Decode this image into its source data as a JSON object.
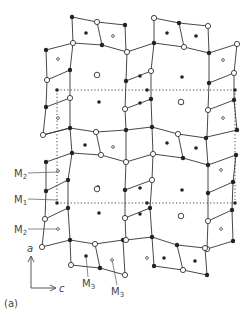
{
  "figure": {
    "panel_label": "(a)",
    "axes": {
      "vertical": "a",
      "horizontal": "c"
    },
    "site_labels": [
      {
        "text": "M",
        "sub": "2",
        "x": 14,
        "y": 177,
        "tx": 58,
        "ty": 172
      },
      {
        "text": "M",
        "sub": "1",
        "x": 14,
        "y": 203,
        "tx": 58,
        "ty": 200
      },
      {
        "text": "M",
        "sub": "2",
        "x": 14,
        "y": 233,
        "tx": 58,
        "ty": 229
      },
      {
        "text": "M",
        "sub": "3",
        "x": 82,
        "y": 287,
        "tx": 86,
        "ty": 256
      },
      {
        "text": "M",
        "sub": "3",
        "x": 111,
        "y": 295,
        "tx": 112,
        "ty": 260
      }
    ],
    "legend": {
      "filled": "filled circle",
      "open": "open circle",
      "dot": "small dot"
    },
    "colors": {
      "line": "#333333",
      "dotted": "#444444",
      "text": "#444444"
    }
  },
  "lattice": {
    "edges": [
      [
        [
          72,
          17
        ],
        [
          97,
          22
        ]
      ],
      [
        [
          97,
          22
        ],
        [
          125,
          25
        ]
      ],
      [
        [
          72,
          17
        ],
        [
          73,
          43
        ]
      ],
      [
        [
          97,
          22
        ],
        [
          102,
          45
        ]
      ],
      [
        [
          125,
          25
        ],
        [
          126,
          52
        ]
      ],
      [
        [
          73,
          43
        ],
        [
          102,
          45
        ]
      ],
      [
        [
          102,
          45
        ],
        [
          127,
          52
        ]
      ],
      [
        [
          154,
          18
        ],
        [
          179,
          23
        ]
      ],
      [
        [
          179,
          23
        ],
        [
          208,
          26
        ]
      ],
      [
        [
          154,
          18
        ],
        [
          154,
          43
        ]
      ],
      [
        [
          179,
          23
        ],
        [
          184,
          47
        ]
      ],
      [
        [
          208,
          26
        ],
        [
          209,
          53
        ]
      ],
      [
        [
          154,
          43
        ],
        [
          184,
          47
        ]
      ],
      [
        [
          184,
          47
        ],
        [
          209,
          53
        ]
      ],
      [
        [
          127,
          52
        ],
        [
          154,
          43
        ]
      ],
      [
        [
          46,
          50
        ],
        [
          73,
          43
        ]
      ],
      [
        [
          209,
          53
        ],
        [
          237,
          44
        ]
      ],
      [
        [
          46,
          50
        ],
        [
          47,
          80
        ]
      ],
      [
        [
          47,
          80
        ],
        [
          46,
          107
        ]
      ],
      [
        [
          46,
          107
        ],
        [
          43,
          135
        ]
      ],
      [
        [
          47,
          80
        ],
        [
          70,
          70
        ]
      ],
      [
        [
          46,
          107
        ],
        [
          70,
          98
        ]
      ],
      [
        [
          43,
          135
        ],
        [
          70,
          128
        ]
      ],
      [
        [
          73,
          43
        ],
        [
          70,
          70
        ]
      ],
      [
        [
          70,
          70
        ],
        [
          70,
          98
        ]
      ],
      [
        [
          70,
          98
        ],
        [
          70,
          128
        ]
      ],
      [
        [
          127,
          52
        ],
        [
          126,
          81
        ]
      ],
      [
        [
          126,
          81
        ],
        [
          125,
          109
        ]
      ],
      [
        [
          125,
          109
        ],
        [
          126,
          130
        ]
      ],
      [
        [
          126,
          81
        ],
        [
          151,
          71
        ]
      ],
      [
        [
          125,
          109
        ],
        [
          151,
          99
        ]
      ],
      [
        [
          151,
          71
        ],
        [
          154,
          43
        ]
      ],
      [
        [
          151,
          71
        ],
        [
          151,
          99
        ]
      ],
      [
        [
          151,
          99
        ],
        [
          152,
          127
        ]
      ],
      [
        [
          209,
          53
        ],
        [
          209,
          83
        ]
      ],
      [
        [
          209,
          83
        ],
        [
          208,
          110
        ]
      ],
      [
        [
          208,
          110
        ],
        [
          207,
          137
        ]
      ],
      [
        [
          209,
          83
        ],
        [
          234,
          73
        ]
      ],
      [
        [
          208,
          110
        ],
        [
          234,
          100
        ]
      ],
      [
        [
          207,
          137
        ],
        [
          237,
          130
        ]
      ],
      [
        [
          237,
          44
        ],
        [
          234,
          73
        ]
      ],
      [
        [
          234,
          73
        ],
        [
          234,
          100
        ]
      ],
      [
        [
          234,
          100
        ],
        [
          237,
          130
        ]
      ],
      [
        [
          70,
          128
        ],
        [
          96,
          132
        ]
      ],
      [
        [
          96,
          132
        ],
        [
          126,
          130
        ]
      ],
      [
        [
          70,
          128
        ],
        [
          72,
          153
        ]
      ],
      [
        [
          96,
          132
        ],
        [
          101,
          155
        ]
      ],
      [
        [
          72,
          153
        ],
        [
          101,
          155
        ]
      ],
      [
        [
          101,
          155
        ],
        [
          126,
          162
        ]
      ],
      [
        [
          126,
          130
        ],
        [
          126,
          162
        ]
      ],
      [
        [
          152,
          127
        ],
        [
          178,
          134
        ]
      ],
      [
        [
          178,
          134
        ],
        [
          206,
          138
        ]
      ],
      [
        [
          152,
          127
        ],
        [
          153,
          154
        ]
      ],
      [
        [
          178,
          134
        ],
        [
          183,
          158
        ]
      ],
      [
        [
          153,
          154
        ],
        [
          183,
          158
        ]
      ],
      [
        [
          183,
          158
        ],
        [
          208,
          165
        ]
      ],
      [
        [
          206,
          138
        ],
        [
          208,
          165
        ]
      ],
      [
        [
          126,
          130
        ],
        [
          152,
          127
        ]
      ],
      [
        [
          126,
          162
        ],
        [
          153,
          154
        ]
      ],
      [
        [
          43,
          135
        ],
        [
          70,
          128
        ]
      ],
      [
        [
          46,
          162
        ],
        [
          72,
          153
        ]
      ],
      [
        [
          46,
          162
        ],
        [
          46,
          191
        ]
      ],
      [
        [
          46,
          191
        ],
        [
          45,
          219
        ]
      ],
      [
        [
          45,
          219
        ],
        [
          42,
          247
        ]
      ],
      [
        [
          46,
          191
        ],
        [
          68,
          180
        ]
      ],
      [
        [
          45,
          219
        ],
        [
          68,
          208
        ]
      ],
      [
        [
          42,
          247
        ],
        [
          70,
          240
        ]
      ],
      [
        [
          72,
          153
        ],
        [
          68,
          180
        ]
      ],
      [
        [
          68,
          180
        ],
        [
          68,
          208
        ]
      ],
      [
        [
          68,
          208
        ],
        [
          70,
          240
        ]
      ],
      [
        [
          126,
          162
        ],
        [
          125,
          190
        ]
      ],
      [
        [
          125,
          190
        ],
        [
          125,
          218
        ]
      ],
      [
        [
          125,
          218
        ],
        [
          126,
          240
        ]
      ],
      [
        [
          125,
          190
        ],
        [
          152,
          180
        ]
      ],
      [
        [
          125,
          218
        ],
        [
          150,
          208
        ]
      ],
      [
        [
          153,
          154
        ],
        [
          152,
          180
        ]
      ],
      [
        [
          152,
          180
        ],
        [
          150,
          208
        ]
      ],
      [
        [
          150,
          208
        ],
        [
          152,
          237
        ]
      ],
      [
        [
          208,
          165
        ],
        [
          208,
          193
        ]
      ],
      [
        [
          208,
          193
        ],
        [
          208,
          221
        ]
      ],
      [
        [
          208,
          221
        ],
        [
          207,
          249
        ]
      ],
      [
        [
          208,
          193
        ],
        [
          233,
          182
        ]
      ],
      [
        [
          208,
          221
        ],
        [
          232,
          210
        ]
      ],
      [
        [
          207,
          249
        ],
        [
          233,
          241
        ]
      ],
      [
        [
          236,
          155
        ],
        [
          233,
          182
        ]
      ],
      [
        [
          233,
          182
        ],
        [
          232,
          210
        ]
      ],
      [
        [
          232,
          210
        ],
        [
          233,
          241
        ]
      ],
      [
        [
          208,
          165
        ],
        [
          236,
          155
        ]
      ],
      [
        [
          70,
          240
        ],
        [
          95,
          244
        ]
      ],
      [
        [
          95,
          244
        ],
        [
          123,
          240
        ]
      ],
      [
        [
          70,
          240
        ],
        [
          71,
          265
        ]
      ],
      [
        [
          95,
          244
        ],
        [
          100,
          268
        ]
      ],
      [
        [
          71,
          265
        ],
        [
          100,
          268
        ]
      ],
      [
        [
          100,
          268
        ],
        [
          125,
          275
        ]
      ],
      [
        [
          123,
          240
        ],
        [
          125,
          275
        ]
      ],
      [
        [
          126,
          240
        ],
        [
          152,
          237
        ]
      ],
      [
        [
          152,
          237
        ],
        [
          177,
          245
        ]
      ],
      [
        [
          177,
          245
        ],
        [
          205,
          248
        ]
      ],
      [
        [
          152,
          237
        ],
        [
          154,
          266
        ]
      ],
      [
        [
          177,
          245
        ],
        [
          183,
          270
        ]
      ],
      [
        [
          154,
          266
        ],
        [
          183,
          270
        ]
      ],
      [
        [
          183,
          270
        ],
        [
          207,
          275
        ]
      ],
      [
        [
          205,
          248
        ],
        [
          207,
          275
        ]
      ]
    ],
    "filled_nodes": [
      [
        72,
        17
      ],
      [
        125,
        25
      ],
      [
        102,
        45
      ],
      [
        179,
        23
      ],
      [
        154,
        43
      ],
      [
        209,
        53
      ],
      [
        46,
        50
      ],
      [
        70,
        70
      ],
      [
        46,
        107
      ],
      [
        70,
        128
      ],
      [
        126,
        81
      ],
      [
        151,
        99
      ],
      [
        209,
        83
      ],
      [
        234,
        100
      ],
      [
        237,
        130
      ],
      [
        96,
        132
      ],
      [
        72,
        153
      ],
      [
        126,
        130
      ],
      [
        152,
        127
      ],
      [
        206,
        138
      ],
      [
        183,
        158
      ],
      [
        208,
        165
      ],
      [
        236,
        155
      ],
      [
        46,
        162
      ],
      [
        68,
        180
      ],
      [
        46,
        191
      ],
      [
        68,
        208
      ],
      [
        70,
        240
      ],
      [
        125,
        190
      ],
      [
        150,
        208
      ],
      [
        152,
        237
      ],
      [
        208,
        193
      ],
      [
        233,
        182
      ],
      [
        232,
        210
      ],
      [
        233,
        241
      ],
      [
        123,
        240
      ],
      [
        100,
        268
      ],
      [
        154,
        266
      ],
      [
        207,
        275
      ],
      [
        177,
        245
      ]
    ],
    "open_nodes": [
      [
        97,
        22
      ],
      [
        73,
        43
      ],
      [
        127,
        52
      ],
      [
        154,
        18
      ],
      [
        208,
        26
      ],
      [
        184,
        47
      ],
      [
        237,
        44
      ],
      [
        47,
        80
      ],
      [
        70,
        98
      ],
      [
        43,
        135
      ],
      [
        125,
        109
      ],
      [
        151,
        71
      ],
      [
        208,
        110
      ],
      [
        234,
        73
      ],
      [
        101,
        155
      ],
      [
        126,
        162
      ],
      [
        153,
        154
      ],
      [
        178,
        134
      ],
      [
        96,
        132
      ],
      [
        45,
        219
      ],
      [
        42,
        247
      ],
      [
        125,
        218
      ],
      [
        152,
        180
      ],
      [
        208,
        221
      ],
      [
        207,
        249
      ],
      [
        95,
        244
      ],
      [
        71,
        265
      ],
      [
        125,
        275
      ],
      [
        126,
        240
      ],
      [
        183,
        270
      ],
      [
        205,
        248
      ]
    ],
    "large_dots": [
      [
        86,
        33
      ],
      [
        167,
        33
      ],
      [
        196,
        36
      ],
      [
        98,
        75
      ],
      [
        140,
        76
      ],
      [
        99,
        102
      ],
      [
        140,
        103
      ],
      [
        182,
        77
      ],
      [
        182,
        103
      ],
      [
        85,
        145
      ],
      [
        167,
        143
      ],
      [
        196,
        148
      ],
      [
        98,
        187
      ],
      [
        140,
        188
      ],
      [
        99,
        213
      ],
      [
        140,
        214
      ],
      [
        182,
        190
      ],
      [
        86,
        256
      ],
      [
        164,
        258
      ],
      [
        195,
        261
      ]
    ],
    "small_dots": [
      [
        113,
        36
      ],
      [
        58,
        59
      ],
      [
        58,
        118
      ],
      [
        223,
        60
      ],
      [
        223,
        118
      ],
      [
        113,
        147
      ],
      [
        58,
        171
      ],
      [
        58,
        229
      ],
      [
        221,
        170
      ],
      [
        221,
        229
      ],
      [
        112,
        260
      ],
      [
        147,
        258
      ]
    ],
    "open_centers": [
      [
        97,
        75
      ],
      [
        181,
        102
      ],
      [
        97,
        189
      ],
      [
        181,
        216
      ]
    ],
    "dotted_lines": [
      [
        [
          57,
          90
        ],
        [
          235,
          90
        ]
      ],
      [
        [
          57,
          90
        ],
        [
          57,
          203
        ]
      ],
      [
        [
          57,
          203
        ],
        [
          235,
          203
        ]
      ],
      [
        [
          235,
          90
        ],
        [
          235,
          203
        ]
      ]
    ],
    "dotted_ends": [
      [
        57,
        90
      ],
      [
        147,
        90
      ],
      [
        57,
        203
      ],
      [
        147,
        203
      ],
      [
        235,
        90
      ],
      [
        235,
        203
      ]
    ]
  }
}
